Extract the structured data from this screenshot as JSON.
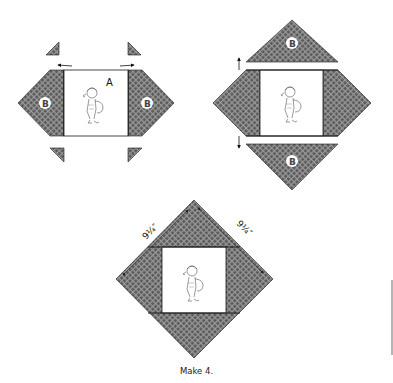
{
  "figure": {
    "caption": "Make 4.",
    "colors": {
      "fabric_dark": "#5a5a5a",
      "fabric_light": "#a8a8a8",
      "outline": "#1a1a1a",
      "background": "#ffffff"
    },
    "step1": {
      "center_label": "A",
      "side_piece_label_left": "B",
      "side_piece_label_right": "B",
      "pressing_arrows": "outward"
    },
    "step2": {
      "top_piece_label": "B",
      "bottom_piece_label": "B",
      "pressing_arrows": "outward"
    },
    "step3": {
      "dimension_left": "9¼″",
      "dimension_right": "9¼″"
    }
  }
}
